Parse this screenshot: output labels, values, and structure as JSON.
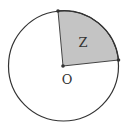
{
  "diagram": {
    "type": "circle-sector",
    "center_label": "O",
    "sector_label": "Z",
    "colors": {
      "sector_fill": "#c4c4c4",
      "stroke": "#333333",
      "background": "#ffffff"
    },
    "geometry": {
      "center": [
        63,
        66
      ],
      "radius": 55,
      "sector_start_point": [
        58,
        10
      ],
      "sector_end_point": [
        118,
        60
      ]
    }
  }
}
